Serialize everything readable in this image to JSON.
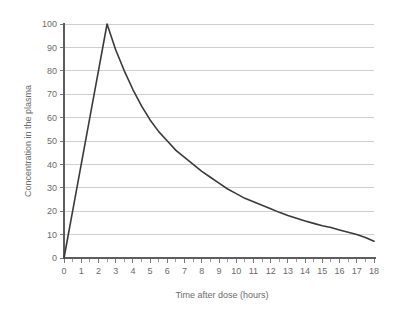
{
  "chart_data": {
    "type": "line",
    "title": "",
    "subtitle": "",
    "xlabel": "Time after dose (hours)",
    "ylabel": "Concentration in the plasma",
    "xlim": [
      0,
      18
    ],
    "ylim": [
      0,
      100
    ],
    "grid": "horizontal",
    "legend": "none",
    "x_ticks": [
      0,
      1,
      2,
      3,
      4,
      5,
      6,
      7,
      8,
      9,
      10,
      11,
      12,
      13,
      14,
      15,
      16,
      17,
      18
    ],
    "x_tick_labels": [
      "0",
      "1",
      "2",
      "3",
      "4",
      "5",
      "6",
      "7",
      "8",
      "9",
      "10",
      "11",
      "12",
      "13",
      "14",
      "15",
      "16",
      "17",
      "18"
    ],
    "x_minor_tick_step": 0.5,
    "y_ticks": [
      0,
      10,
      20,
      30,
      40,
      50,
      60,
      70,
      80,
      90,
      100
    ],
    "y_tick_labels": [
      "0",
      "10",
      "20",
      "30",
      "40",
      "50",
      "60",
      "70",
      "80",
      "90",
      "100"
    ],
    "series": [
      {
        "name": "Plasma concentration",
        "color": "#3a3a3a",
        "x": [
          0,
          0.5,
          1,
          1.5,
          2,
          2.5,
          3,
          3.5,
          4,
          4.5,
          5,
          5.5,
          6,
          6.5,
          7,
          7.5,
          8,
          8.5,
          9,
          9.5,
          10,
          10.5,
          11,
          11.5,
          12,
          12.5,
          13,
          13.5,
          14,
          14.5,
          15,
          15.5,
          16,
          16.5,
          17,
          17.5,
          18
        ],
        "y": [
          0,
          20,
          40,
          60,
          80,
          100,
          89,
          80,
          72,
          65,
          59,
          54,
          50,
          46,
          43,
          40,
          37,
          34.5,
          32,
          29.5,
          27.5,
          25.5,
          24,
          22.5,
          21,
          19.5,
          18.2,
          17,
          15.8,
          14.8,
          13.8,
          13,
          12,
          11,
          10,
          8.8,
          7.2
        ]
      }
    ],
    "annotations": {
      "peak_time_hours": 2.5,
      "peak_concentration": 100
    },
    "colors": {
      "line": "#3a3a3a",
      "grid": "#cfcfcf",
      "axis": "#5d5d5d",
      "text": "#6b6b6b",
      "background": "#ffffff"
    }
  }
}
